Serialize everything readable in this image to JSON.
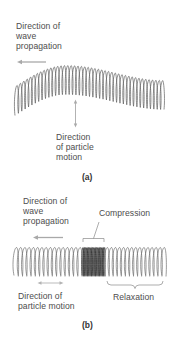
{
  "figure": {
    "panel_a": {
      "label": "(a)",
      "wave_direction_label": [
        "Direction of",
        "wave",
        "propagation"
      ],
      "particle_direction_label": [
        "Direction",
        "of particle",
        "motion"
      ],
      "wave_type": "transverse"
    },
    "panel_b": {
      "label": "(b)",
      "wave_direction_label": [
        "Direction of",
        "wave",
        "propagation"
      ],
      "compression_label": "Compression",
      "relaxation_label": "Relaxation",
      "particle_direction_label": [
        "Direction of",
        "particle motion"
      ],
      "wave_type": "longitudinal"
    }
  },
  "colors": {
    "spring": "#5a5a5a",
    "spring_compressed": "#333333",
    "arrow": "#a8a8a8",
    "text": "#4d4d4d",
    "bracket": "#8a8a8a"
  }
}
